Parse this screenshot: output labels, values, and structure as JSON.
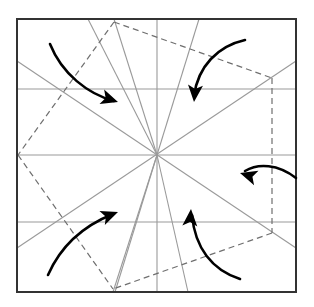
{
  "figure": {
    "canvas": {
      "width": 314,
      "height": 307,
      "background": "#ffffff"
    },
    "colors": {
      "border": "#333333",
      "grid": "#9a9a9a",
      "crease": "#9a9a9a",
      "dashed": "#6f6f6f",
      "arrow": "#000000"
    },
    "square": {
      "label": "outer-square",
      "x": 17,
      "y": 19,
      "width": 279,
      "height": 273,
      "stroke_width": 2
    },
    "center": {
      "x": 157,
      "y": 155
    },
    "grid_lines": [
      {
        "name": "horizontal-upper",
        "x1": 17,
        "y1": 89,
        "x2": 296,
        "y2": 89
      },
      {
        "name": "horizontal-middle",
        "x1": 17,
        "y1": 155,
        "x2": 296,
        "y2": 155
      },
      {
        "name": "horizontal-lower",
        "x1": 17,
        "y1": 222,
        "x2": 296,
        "y2": 222
      },
      {
        "name": "vertical-center",
        "x1": 157,
        "y1": 19,
        "x2": 157,
        "y2": 292
      }
    ],
    "crease_lines": [
      {
        "name": "crease-diagonal-left-down",
        "x1": 17,
        "y1": 61,
        "x2": 296,
        "y2": 248
      },
      {
        "name": "crease-diagonal-left-up",
        "x1": 17,
        "y1": 248,
        "x2": 296,
        "y2": 61
      },
      {
        "name": "crease-to-top-vertex",
        "x1": 157,
        "y1": 155,
        "x2": 114,
        "y2": 19
      },
      {
        "name": "crease-to-bottom-vertex",
        "x1": 157,
        "y1": 155,
        "x2": 113,
        "y2": 292
      },
      {
        "name": "crease-upper-right-steep",
        "x1": 157,
        "y1": 155,
        "x2": 199,
        "y2": 19
      },
      {
        "name": "crease-lower-left-steep",
        "x1": 157,
        "y1": 155,
        "x2": 115,
        "y2": 292
      },
      {
        "name": "crease-upper-left-steep",
        "x1": 157,
        "y1": 155,
        "x2": 88,
        "y2": 19
      },
      {
        "name": "crease-lower-right-steep",
        "x1": 157,
        "y1": 155,
        "x2": 188,
        "y2": 292
      }
    ],
    "dashed_polygon": {
      "name": "inscribed-dashed-square",
      "points": "114,22 272,78 272,233 113,289",
      "vertices": [
        {
          "name": "vertex-top",
          "x": 114,
          "y": 22
        },
        {
          "name": "vertex-right-upper",
          "x": 272,
          "y": 78
        },
        {
          "name": "vertex-right-lower",
          "x": 272,
          "y": 233
        },
        {
          "name": "vertex-bottom",
          "x": 113,
          "y": 289
        }
      ]
    },
    "dashed_lines": [
      {
        "name": "dashed-left-upper",
        "x1": 114,
        "y1": 22,
        "x2": 18,
        "y2": 155
      },
      {
        "name": "dashed-left-lower",
        "x1": 18,
        "y1": 155,
        "x2": 113,
        "y2": 289
      }
    ],
    "arrows": [
      {
        "name": "arrow-top-left-clockwise",
        "direction": "right-down",
        "path": "M 50,44 C 62,74 88,94 114,101",
        "tip": {
          "x": 118,
          "y": 102,
          "angle": 18
        }
      },
      {
        "name": "arrow-top-right-clockwise",
        "direction": "down",
        "path": "M 245,40 C 218,46 198,66 194,96",
        "tip": {
          "x": 194,
          "y": 102,
          "angle": 95
        }
      },
      {
        "name": "arrow-right-clockwise",
        "direction": "left",
        "path": "M 296,178 C 278,164 258,163 245,171",
        "tip": {
          "x": 240,
          "y": 173,
          "angle": 197
        }
      },
      {
        "name": "arrow-bottom-left-clockwise",
        "direction": "right-up",
        "path": "M 48,275 C 62,243 88,224 113,214",
        "tip": {
          "x": 118,
          "y": 212,
          "angle": -21
        }
      },
      {
        "name": "arrow-bottom-right-clockwise",
        "direction": "up",
        "path": "M 240,279 C 212,270 195,248 192,215",
        "tip": {
          "x": 191,
          "y": 209,
          "angle": -86
        }
      }
    ]
  }
}
